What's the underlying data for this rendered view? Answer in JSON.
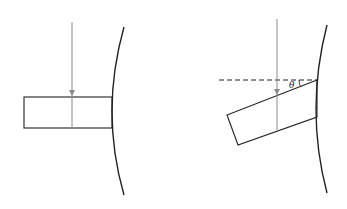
{
  "diagram": {
    "panels": [
      {
        "name": "untilted",
        "wall_arc": {
          "top": [
            124,
            27
          ],
          "mid": [
            112,
            112
          ],
          "bottom": [
            124,
            195
          ]
        },
        "block": {
          "x": 24,
          "y": 97,
          "width": 88,
          "height": 31
        },
        "force_line": {
          "x": 72,
          "y1": 22,
          "y2": 128,
          "arrow_at": 93
        }
      },
      {
        "name": "tilted",
        "wall_arc": {
          "top": [
            327,
            25
          ],
          "mid": [
            317,
            110
          ],
          "bottom": [
            327,
            193
          ]
        },
        "block": {
          "points": [
            [
              317,
              80
            ],
            [
              227,
              115
            ],
            [
              238,
              145
            ],
            [
              317,
              117
            ]
          ]
        },
        "force_line": {
          "x": 277,
          "y1": 19,
          "y2": 130,
          "arrow_at": 92
        },
        "reference_line": {
          "x1": 219,
          "x2": 317,
          "y": 80,
          "style": "dashed"
        },
        "angle_label": "θ",
        "angle_label_pos": [
          290,
          86
        ]
      }
    ],
    "colors": {
      "stroke": "#222222",
      "force": "#8a8a8a"
    }
  }
}
